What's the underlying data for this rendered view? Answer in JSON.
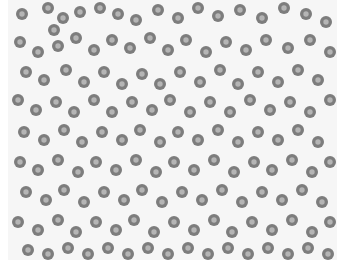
{
  "image": {
    "subject": "blood smear micrograph of red blood cells",
    "colors": {
      "background": "#f6f6f6",
      "cell_rim": "#7d7d7d",
      "cell_center": "#b5b5b5",
      "margin": "#ffffff"
    },
    "cells": [
      [
        14,
        14,
        6
      ],
      [
        40,
        8,
        6
      ],
      [
        55,
        18,
        6
      ],
      [
        46,
        30,
        6
      ],
      [
        72,
        12,
        6
      ],
      [
        92,
        8,
        6
      ],
      [
        110,
        14,
        6
      ],
      [
        128,
        20,
        6
      ],
      [
        150,
        10,
        6
      ],
      [
        170,
        18,
        6
      ],
      [
        190,
        8,
        6
      ],
      [
        210,
        16,
        6
      ],
      [
        232,
        10,
        6
      ],
      [
        254,
        18,
        6
      ],
      [
        276,
        8,
        6
      ],
      [
        298,
        14,
        6
      ],
      [
        318,
        22,
        6
      ],
      [
        12,
        42,
        6
      ],
      [
        30,
        52,
        6
      ],
      [
        50,
        46,
        6
      ],
      [
        68,
        38,
        6
      ],
      [
        86,
        50,
        6
      ],
      [
        104,
        40,
        6
      ],
      [
        122,
        48,
        6
      ],
      [
        142,
        38,
        6
      ],
      [
        160,
        50,
        6
      ],
      [
        178,
        40,
        6
      ],
      [
        198,
        52,
        6
      ],
      [
        218,
        42,
        6
      ],
      [
        238,
        50,
        6
      ],
      [
        258,
        40,
        6
      ],
      [
        280,
        48,
        6
      ],
      [
        302,
        40,
        6
      ],
      [
        322,
        52,
        6
      ],
      [
        18,
        72,
        6
      ],
      [
        36,
        80,
        6
      ],
      [
        58,
        70,
        6
      ],
      [
        76,
        82,
        6
      ],
      [
        96,
        72,
        6
      ],
      [
        114,
        84,
        6
      ],
      [
        134,
        74,
        6
      ],
      [
        152,
        84,
        6
      ],
      [
        172,
        72,
        6
      ],
      [
        192,
        82,
        6
      ],
      [
        212,
        70,
        6
      ],
      [
        230,
        84,
        6
      ],
      [
        250,
        72,
        6
      ],
      [
        270,
        82,
        6
      ],
      [
        290,
        70,
        6
      ],
      [
        310,
        80,
        6
      ],
      [
        10,
        100,
        6
      ],
      [
        28,
        110,
        6
      ],
      [
        48,
        102,
        6
      ],
      [
        66,
        112,
        6
      ],
      [
        86,
        100,
        6
      ],
      [
        104,
        112,
        6
      ],
      [
        124,
        102,
        6
      ],
      [
        144,
        110,
        6
      ],
      [
        162,
        100,
        6
      ],
      [
        182,
        112,
        6
      ],
      [
        202,
        102,
        6
      ],
      [
        222,
        112,
        6
      ],
      [
        242,
        100,
        6
      ],
      [
        262,
        110,
        6
      ],
      [
        282,
        102,
        6
      ],
      [
        302,
        112,
        6
      ],
      [
        322,
        100,
        6
      ],
      [
        16,
        132,
        6
      ],
      [
        36,
        140,
        6
      ],
      [
        56,
        130,
        6
      ],
      [
        74,
        142,
        6
      ],
      [
        94,
        132,
        6
      ],
      [
        114,
        140,
        6
      ],
      [
        132,
        130,
        6
      ],
      [
        152,
        142,
        6
      ],
      [
        170,
        132,
        6
      ],
      [
        190,
        140,
        6
      ],
      [
        210,
        130,
        6
      ],
      [
        230,
        142,
        6
      ],
      [
        250,
        132,
        6
      ],
      [
        270,
        140,
        6
      ],
      [
        290,
        130,
        6
      ],
      [
        310,
        142,
        6
      ],
      [
        12,
        162,
        6
      ],
      [
        30,
        170,
        6
      ],
      [
        50,
        160,
        6
      ],
      [
        70,
        172,
        6
      ],
      [
        88,
        162,
        6
      ],
      [
        108,
        170,
        6
      ],
      [
        128,
        160,
        6
      ],
      [
        148,
        172,
        6
      ],
      [
        166,
        162,
        6
      ],
      [
        186,
        170,
        6
      ],
      [
        206,
        160,
        6
      ],
      [
        226,
        172,
        6
      ],
      [
        246,
        162,
        6
      ],
      [
        264,
        170,
        6
      ],
      [
        284,
        160,
        6
      ],
      [
        304,
        172,
        6
      ],
      [
        322,
        162,
        6
      ],
      [
        18,
        192,
        6
      ],
      [
        38,
        200,
        6
      ],
      [
        56,
        190,
        6
      ],
      [
        76,
        202,
        6
      ],
      [
        96,
        192,
        6
      ],
      [
        116,
        200,
        6
      ],
      [
        134,
        190,
        6
      ],
      [
        154,
        202,
        6
      ],
      [
        174,
        192,
        6
      ],
      [
        194,
        200,
        6
      ],
      [
        214,
        190,
        6
      ],
      [
        234,
        202,
        6
      ],
      [
        254,
        192,
        6
      ],
      [
        274,
        200,
        6
      ],
      [
        294,
        190,
        6
      ],
      [
        314,
        202,
        6
      ],
      [
        10,
        222,
        6
      ],
      [
        30,
        230,
        6
      ],
      [
        50,
        220,
        6
      ],
      [
        68,
        232,
        6
      ],
      [
        88,
        222,
        6
      ],
      [
        108,
        230,
        6
      ],
      [
        126,
        220,
        6
      ],
      [
        146,
        232,
        6
      ],
      [
        166,
        222,
        6
      ],
      [
        186,
        230,
        6
      ],
      [
        206,
        220,
        6
      ],
      [
        224,
        232,
        6
      ],
      [
        244,
        222,
        6
      ],
      [
        264,
        230,
        6
      ],
      [
        284,
        220,
        6
      ],
      [
        304,
        232,
        6
      ],
      [
        322,
        222,
        6
      ],
      [
        20,
        250,
        6
      ],
      [
        40,
        254,
        6
      ],
      [
        60,
        248,
        6
      ],
      [
        80,
        254,
        6
      ],
      [
        100,
        248,
        6
      ],
      [
        120,
        254,
        6
      ],
      [
        140,
        248,
        6
      ],
      [
        160,
        254,
        6
      ],
      [
        180,
        248,
        6
      ],
      [
        200,
        254,
        6
      ],
      [
        220,
        248,
        6
      ],
      [
        240,
        254,
        6
      ],
      [
        260,
        248,
        6
      ],
      [
        280,
        254,
        6
      ],
      [
        300,
        248,
        6
      ],
      [
        320,
        254,
        6
      ]
    ]
  }
}
